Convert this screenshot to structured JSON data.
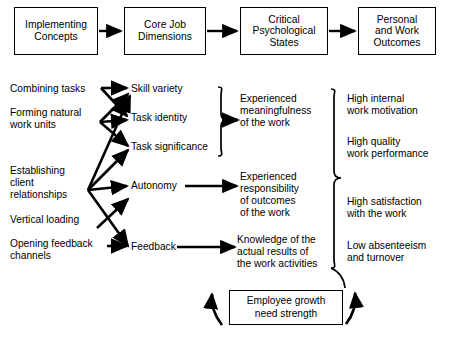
{
  "diagram": {
    "stroke_color": "#000000",
    "background_color": "#ffffff",
    "header_boxes": [
      {
        "id": "implementing-concepts",
        "label": "Implementing\nConcepts"
      },
      {
        "id": "core-job-dimensions",
        "label": "Core Job\nDimensions"
      },
      {
        "id": "critical-psychological-states",
        "label": "Critical\nPsychological\nStates"
      },
      {
        "id": "personal-and-work-outcomes",
        "label": "Personal\nand Work\nOutcomes"
      }
    ],
    "implementing_concepts": [
      {
        "id": "combining-tasks",
        "label": "Combining tasks"
      },
      {
        "id": "forming-natural-work-units",
        "label": "Forming natural\nwork units"
      },
      {
        "id": "establishing-client-relationships",
        "label": "Establishing\nclient\nrelationships"
      },
      {
        "id": "vertical-loading",
        "label": "Vertical loading"
      },
      {
        "id": "opening-feedback-channels",
        "label": "Opening feedback\nchannels"
      }
    ],
    "core_job_dimensions": [
      {
        "id": "skill-variety",
        "label": "Skill variety"
      },
      {
        "id": "task-identity",
        "label": "Task identity"
      },
      {
        "id": "task-significance",
        "label": "Task significance"
      },
      {
        "id": "autonomy",
        "label": "Autonomy"
      },
      {
        "id": "feedback",
        "label": "Feedback"
      }
    ],
    "critical_psychological_states": [
      {
        "id": "experienced-meaningfulness",
        "label": "Experienced\nmeaningfulness\nof the work"
      },
      {
        "id": "experienced-responsibility",
        "label": "Experienced\nresponsibility\nof outcomes\nof the work"
      },
      {
        "id": "knowledge-of-results",
        "label": "Knowledge of the\nactual results of\nthe work activities"
      }
    ],
    "personal_and_work_outcomes": [
      {
        "id": "high-internal-work-motivation",
        "label": "High internal\nwork motivation"
      },
      {
        "id": "high-quality-work-performance",
        "label": "High quality\nwork performance"
      },
      {
        "id": "high-satisfaction-with-the-work",
        "label": "High satisfaction\nwith the work"
      },
      {
        "id": "low-absenteeism-and-turnover",
        "label": "Low absenteeism\nand turnover"
      }
    ],
    "moderator": {
      "id": "employee-growth-need-strength",
      "label": "Employee growth\nneed strength"
    }
  }
}
